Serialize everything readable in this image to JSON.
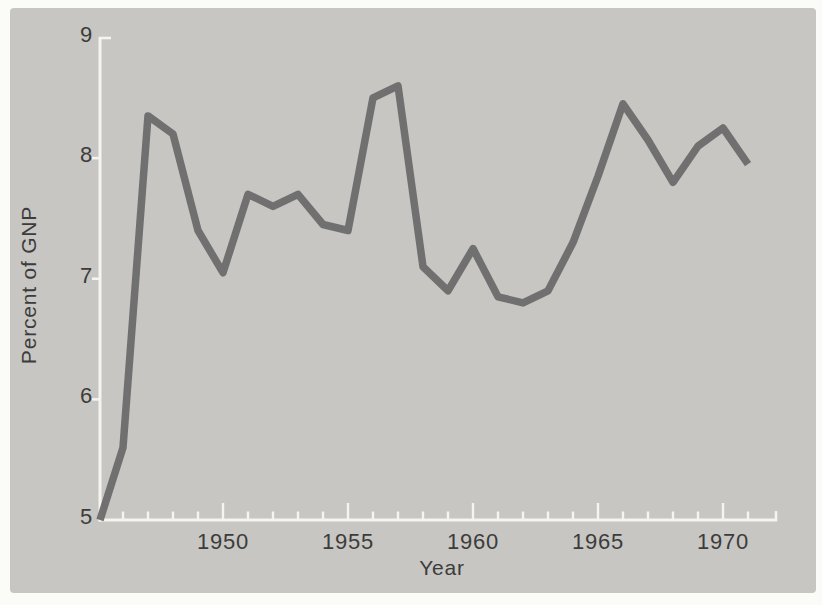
{
  "figure": {
    "page_color": "#fbfbf8",
    "photo_background_color": "#c7c6c2",
    "line_color": "#6c6c6c",
    "axis_color": "#f5f4ef",
    "text_color": "#3c3c3c"
  },
  "chart_data": {
    "type": "line",
    "title": "",
    "xlabel": "Year",
    "ylabel": "Percent of GNP",
    "x": [
      1945,
      1946,
      1947,
      1948,
      1949,
      1950,
      1951,
      1952,
      1953,
      1954,
      1955,
      1956,
      1957,
      1958,
      1959,
      1960,
      1961,
      1962,
      1963,
      1964,
      1965,
      1966,
      1967,
      1968,
      1969,
      1970,
      1971
    ],
    "values": [
      5.0,
      5.6,
      8.35,
      8.2,
      7.4,
      7.05,
      7.7,
      7.6,
      7.7,
      7.45,
      7.4,
      8.5,
      8.6,
      7.1,
      6.9,
      7.25,
      6.85,
      6.8,
      6.9,
      7.3,
      7.85,
      8.45,
      8.15,
      7.8,
      8.1,
      8.25,
      7.95
    ],
    "xlim": [
      1945,
      1972
    ],
    "ylim": [
      5,
      9
    ],
    "y_ticks": [
      5,
      6,
      7,
      8,
      9
    ],
    "y_tick_labels": [
      "5",
      "6",
      "7",
      "8",
      "9"
    ],
    "x_major_ticks": [
      1950,
      1955,
      1960,
      1965,
      1970
    ],
    "x_major_tick_labels": [
      "1950",
      "1955",
      "1960",
      "1965",
      "1970"
    ],
    "x_minor_tick_range": [
      1946,
      1971
    ],
    "grid": false,
    "legend": null
  }
}
